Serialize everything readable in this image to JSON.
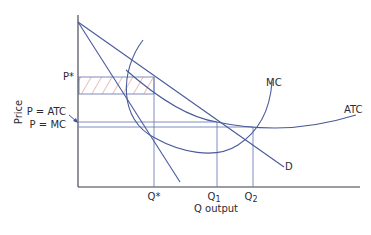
{
  "diagram": {
    "axes": {
      "y_label": "Price",
      "x_label": "Q output"
    },
    "price_labels": {
      "p_star": "P*",
      "p_atc": "P = ATC",
      "p_mc": "P = MC"
    },
    "quantity_labels": {
      "q_star": "Q*",
      "q1": "Q",
      "q1_sub": "1",
      "q2": "Q",
      "q2_sub": "2"
    },
    "curve_labels": {
      "mc": "MC",
      "atc": "ATC",
      "demand": "D"
    },
    "colors": {
      "curve": "#4a5a9a",
      "guide": "#7080b8",
      "hatch": "#e07a6a",
      "axis": "#3a3a48",
      "arrow": "#3a50a0"
    }
  }
}
